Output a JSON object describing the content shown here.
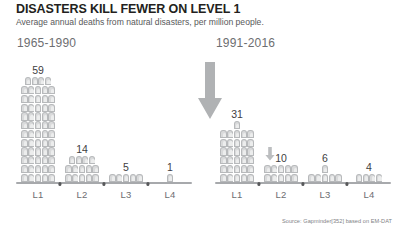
{
  "title": "DISASTERS KILL FEWER ON LEVEL 1",
  "subtitle": "Average annual deaths from natural disasters, per million people.",
  "source": "Source: Gapminder[352] based on EM-DAT",
  "panels": {
    "left": {
      "title": "1965-1990"
    },
    "right": {
      "title": "1991-2016"
    }
  },
  "annotations": {
    "big_arrow": "down-arrow-icon",
    "small_arrow": "small-down-arrow-icon"
  },
  "colors": {
    "icon_fill": "#d9dadb",
    "icon_stroke": "#b7b9bb",
    "arrow": "#a7a9ac",
    "baseline": "#a7a9ac",
    "title_text": "#231f20",
    "subtitle_text": "#58595b",
    "label_text": "#6d6e71"
  },
  "chart_data": {
    "type": "bar",
    "title": "DISASTERS KILL FEWER ON LEVEL 1",
    "subtitle": "Average annual deaths from natural disasters, per million people.",
    "xlabel": "",
    "ylabel": "Average annual deaths per million people",
    "categories": [
      "L1",
      "L2",
      "L3",
      "L4"
    ],
    "series": [
      {
        "name": "1965-1990",
        "values": [
          59,
          14,
          5,
          1
        ]
      },
      {
        "name": "1991-2016",
        "values": [
          31,
          10,
          6,
          4
        ]
      }
    ],
    "units_per_icon": 1,
    "icons_per_row": 5,
    "icon": "tombstone-icon",
    "grid": false,
    "legend": "none",
    "ylim": [
      0,
      59
    ],
    "annotations": [
      "large down arrow between panels",
      "small down arrow above 1991-2016 L2"
    ],
    "source": "Source: Gapminder[352] based on EM-DAT"
  }
}
